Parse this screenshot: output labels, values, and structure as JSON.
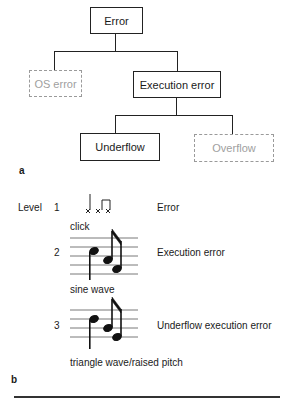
{
  "panel_a": {
    "label": "a",
    "tree": {
      "root": {
        "text": "Error",
        "style": "solid"
      },
      "level1": [
        {
          "text": "OS error",
          "style": "dashed"
        },
        {
          "text": "Execution error",
          "style": "solid"
        }
      ],
      "level2": [
        {
          "text": "Underflow",
          "style": "solid"
        },
        {
          "text": "Overflow",
          "style": "dashed"
        }
      ]
    }
  },
  "panel_b": {
    "label": "b",
    "level_header": "Level",
    "rows": [
      {
        "level": "1",
        "sound": "click",
        "meaning": "Error"
      },
      {
        "level": "2",
        "sound": "sine wave",
        "meaning": "Execution error"
      },
      {
        "level": "3",
        "sound": "triangle wave/raised pitch",
        "meaning": "Underflow execution error"
      }
    ]
  },
  "colors": {
    "ink": "#222222",
    "dashed": "#9a9a9a",
    "dashed_text": "#a0a0a0"
  }
}
